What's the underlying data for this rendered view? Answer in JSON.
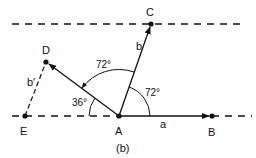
{
  "figure": {
    "caption": "(b)",
    "points": {
      "A": {
        "label": "A",
        "x": 119,
        "y": 116
      },
      "B": {
        "label": "B",
        "x": 212,
        "y": 116
      },
      "C": {
        "label": "C",
        "x": 151,
        "y": 24
      },
      "D": {
        "label": "D",
        "x": 46,
        "y": 62
      },
      "E": {
        "label": "E",
        "x": 25,
        "y": 116
      }
    },
    "vector_labels": {
      "a": "a",
      "b": "b",
      "b_prime": "b′"
    },
    "angles": {
      "angle_CAB": "72°",
      "angle_DAC": "72°",
      "angle_D_EA": "36°"
    }
  },
  "colors": {
    "ink": "#111111",
    "background": "#ffffff"
  }
}
